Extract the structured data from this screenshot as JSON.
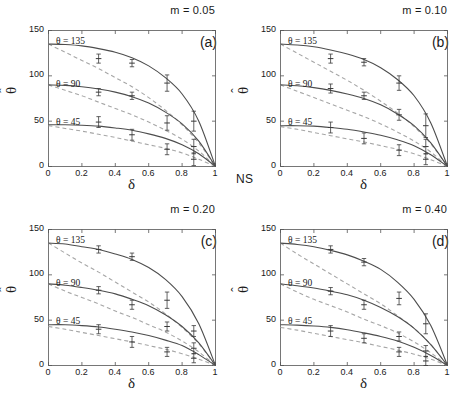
{
  "figure": {
    "ns_label": "NS",
    "xlabel": "δ",
    "ylabel_base": "θ",
    "ylabel_hat": "ˆ",
    "xticks": [
      "0",
      "0.2",
      "0.4",
      "0.6",
      "0.8",
      "1"
    ],
    "yticks": [
      "0",
      "50",
      "100",
      "150"
    ],
    "curve_labels": {
      "t135": "θ = 135",
      "t90": "θ = 90",
      "t45": "θ = 45"
    },
    "colors": {
      "solid_curve": "#4d4d4d",
      "dashed_curve": "#a6a6a6",
      "axis": "#555555",
      "marker": "#3a3a3a",
      "text": "#1a1a1a"
    }
  },
  "chart_data": [
    {
      "type": "line",
      "panel": "a",
      "tag": "(a)",
      "title": "m = 0.05",
      "xlabel": "δ",
      "ylabel": "θ̂",
      "xlim": [
        0,
        1
      ],
      "ylim": [
        0,
        150
      ],
      "grid": false,
      "legend": "inline-labels",
      "series": [
        {
          "name": "θ = 135 solid",
          "style": "solid",
          "x": [
            0,
            0.1,
            0.2,
            0.3,
            0.4,
            0.5,
            0.6,
            0.7,
            0.8,
            0.9,
            1.0
          ],
          "y": [
            135,
            134.5,
            133,
            130,
            126,
            120,
            111,
            98,
            80,
            50,
            0
          ]
        },
        {
          "name": "θ = 90 solid",
          "style": "solid",
          "x": [
            0,
            0.1,
            0.2,
            0.3,
            0.4,
            0.5,
            0.6,
            0.7,
            0.8,
            0.9,
            1.0
          ],
          "y": [
            90,
            89.5,
            88,
            85.5,
            82,
            77,
            70,
            60,
            47,
            28,
            0
          ]
        },
        {
          "name": "θ = 45 solid",
          "style": "solid",
          "x": [
            0,
            0.1,
            0.2,
            0.3,
            0.4,
            0.5,
            0.6,
            0.7,
            0.8,
            0.9,
            1.0
          ],
          "y": [
            46,
            46,
            45.5,
            44.5,
            42.5,
            40,
            36,
            31,
            24,
            14,
            0
          ]
        },
        {
          "name": "θ = 135 dashed",
          "style": "dashed",
          "x": [
            0,
            0.1,
            0.2,
            0.3,
            0.4,
            0.5,
            0.6,
            0.7,
            0.8,
            0.9,
            1.0
          ],
          "y": [
            135,
            126,
            117,
            108,
            98,
            88,
            76,
            62,
            46,
            26,
            0
          ]
        },
        {
          "name": "θ = 90 dashed",
          "style": "dashed",
          "x": [
            0,
            0.1,
            0.2,
            0.3,
            0.4,
            0.5,
            0.6,
            0.7,
            0.8,
            0.9,
            1.0
          ],
          "y": [
            90,
            84,
            78,
            71,
            64,
            57,
            49,
            40,
            30,
            17,
            0
          ]
        },
        {
          "name": "θ = 45 dashed",
          "style": "dashed",
          "x": [
            0,
            0.1,
            0.2,
            0.3,
            0.4,
            0.5,
            0.6,
            0.7,
            0.8,
            0.9,
            1.0
          ],
          "y": [
            45,
            42,
            39,
            35.5,
            32,
            28,
            24,
            20,
            15,
            8,
            0
          ]
        }
      ],
      "points": [
        {
          "group": "135",
          "x": 0.3,
          "y": 119,
          "err": 5
        },
        {
          "group": "135",
          "x": 0.5,
          "y": 114,
          "err": 4
        },
        {
          "group": "135",
          "x": 0.71,
          "y": 92,
          "err": 9
        },
        {
          "group": "135",
          "x": 0.87,
          "y": 50,
          "err": 11
        },
        {
          "group": "90",
          "x": 0.3,
          "y": 82,
          "err": 4
        },
        {
          "group": "90",
          "x": 0.5,
          "y": 78,
          "err": 4
        },
        {
          "group": "90",
          "x": 0.71,
          "y": 48,
          "err": 8
        },
        {
          "group": "90",
          "x": 0.87,
          "y": 22,
          "err": 8
        },
        {
          "group": "45",
          "x": 0.3,
          "y": 49,
          "err": 6
        },
        {
          "group": "45",
          "x": 0.5,
          "y": 35,
          "err": 6
        },
        {
          "group": "45",
          "x": 0.71,
          "y": 19,
          "err": 6
        },
        {
          "group": "45",
          "x": 0.87,
          "y": 8,
          "err": 7
        }
      ]
    },
    {
      "type": "line",
      "panel": "b",
      "tag": "(b)",
      "title": "m = 0.10",
      "xlabel": "δ",
      "ylabel": "θ̂",
      "xlim": [
        0,
        1
      ],
      "ylim": [
        0,
        150
      ],
      "grid": false,
      "legend": "inline-labels",
      "series": [
        {
          "name": "θ = 135 solid",
          "style": "solid",
          "x": [
            0,
            0.1,
            0.2,
            0.3,
            0.4,
            0.5,
            0.6,
            0.7,
            0.8,
            0.9,
            1.0
          ],
          "y": [
            135,
            134,
            132,
            128.5,
            124,
            118,
            109,
            96,
            78,
            48,
            0
          ]
        },
        {
          "name": "θ = 90 solid",
          "style": "solid",
          "x": [
            0,
            0.1,
            0.2,
            0.3,
            0.4,
            0.5,
            0.6,
            0.7,
            0.8,
            0.9,
            1.0
          ],
          "y": [
            90,
            89,
            87,
            84,
            80,
            75,
            68,
            58,
            45,
            26,
            0
          ]
        },
        {
          "name": "θ = 45 solid",
          "style": "solid",
          "x": [
            0,
            0.1,
            0.2,
            0.3,
            0.4,
            0.5,
            0.6,
            0.7,
            0.8,
            0.9,
            1.0
          ],
          "y": [
            45,
            45,
            44.5,
            43,
            41,
            38,
            34.5,
            29.5,
            23,
            13,
            0
          ]
        },
        {
          "name": "θ = 135 dashed",
          "style": "dashed",
          "x": [
            0,
            0.1,
            0.2,
            0.3,
            0.4,
            0.5,
            0.6,
            0.7,
            0.8,
            0.9,
            1.0
          ],
          "y": [
            135,
            125,
            115,
            105,
            95,
            84,
            72,
            59,
            44,
            25,
            0
          ]
        },
        {
          "name": "θ = 90 dashed",
          "style": "dashed",
          "x": [
            0,
            0.1,
            0.2,
            0.3,
            0.4,
            0.5,
            0.6,
            0.7,
            0.8,
            0.9,
            1.0
          ],
          "y": [
            90,
            83,
            76,
            69,
            62,
            55,
            47,
            38,
            28,
            16,
            0
          ]
        },
        {
          "name": "θ = 45 dashed",
          "style": "dashed",
          "x": [
            0,
            0.1,
            0.2,
            0.3,
            0.4,
            0.5,
            0.6,
            0.7,
            0.8,
            0.9,
            1.0
          ],
          "y": [
            44,
            41,
            37.5,
            34,
            30.5,
            27,
            23,
            19,
            14,
            7.5,
            0
          ]
        }
      ],
      "points": [
        {
          "group": "135",
          "x": 0.3,
          "y": 119,
          "err": 5
        },
        {
          "group": "135",
          "x": 0.5,
          "y": 115,
          "err": 4
        },
        {
          "group": "135",
          "x": 0.71,
          "y": 92,
          "err": 8
        },
        {
          "group": "135",
          "x": 0.87,
          "y": 45,
          "err": 13
        },
        {
          "group": "90",
          "x": 0.3,
          "y": 86,
          "err": 5
        },
        {
          "group": "90",
          "x": 0.5,
          "y": 78,
          "err": 4
        },
        {
          "group": "90",
          "x": 0.71,
          "y": 57,
          "err": 6
        },
        {
          "group": "90",
          "x": 0.87,
          "y": 22,
          "err": 8
        },
        {
          "group": "45",
          "x": 0.3,
          "y": 43,
          "err": 6
        },
        {
          "group": "45",
          "x": 0.5,
          "y": 31,
          "err": 6
        },
        {
          "group": "45",
          "x": 0.71,
          "y": 18,
          "err": 6
        },
        {
          "group": "45",
          "x": 0.87,
          "y": 8,
          "err": 6
        }
      ]
    },
    {
      "type": "line",
      "panel": "c",
      "tag": "(c)",
      "title": "m = 0.20",
      "xlabel": "δ",
      "ylabel": "θ̂",
      "xlim": [
        0,
        1
      ],
      "ylim": [
        0,
        150
      ],
      "grid": false,
      "legend": "inline-labels",
      "series": [
        {
          "name": "θ = 135 solid",
          "style": "solid",
          "x": [
            0,
            0.1,
            0.2,
            0.3,
            0.4,
            0.5,
            0.6,
            0.7,
            0.8,
            0.9,
            1.0
          ],
          "y": [
            135,
            134,
            131,
            128,
            123,
            117,
            108,
            95,
            76,
            46,
            0
          ]
        },
        {
          "name": "θ = 90 solid",
          "style": "solid",
          "x": [
            0,
            0.1,
            0.2,
            0.3,
            0.4,
            0.5,
            0.6,
            0.7,
            0.8,
            0.9,
            1.0
          ],
          "y": [
            90,
            88.5,
            86,
            83,
            79,
            73,
            66,
            56,
            43,
            25,
            0
          ]
        },
        {
          "name": "θ = 45 solid",
          "style": "solid",
          "x": [
            0,
            0.1,
            0.2,
            0.3,
            0.4,
            0.5,
            0.6,
            0.7,
            0.8,
            0.9,
            1.0
          ],
          "y": [
            45,
            45,
            44,
            42.5,
            40,
            37,
            33,
            28,
            22,
            12,
            0
          ]
        },
        {
          "name": "θ = 135 dashed",
          "style": "dashed",
          "x": [
            0,
            0.1,
            0.2,
            0.3,
            0.4,
            0.5,
            0.6,
            0.7,
            0.8,
            0.9,
            1.0
          ],
          "y": [
            135,
            124,
            113,
            103,
            92,
            81,
            70,
            57,
            42,
            24,
            0
          ]
        },
        {
          "name": "θ = 90 dashed",
          "style": "dashed",
          "x": [
            0,
            0.1,
            0.2,
            0.3,
            0.4,
            0.5,
            0.6,
            0.7,
            0.8,
            0.9,
            1.0
          ],
          "y": [
            90,
            82,
            75,
            68,
            60,
            53,
            45,
            37,
            27,
            15,
            0
          ]
        },
        {
          "name": "θ = 45 dashed",
          "style": "dashed",
          "x": [
            0,
            0.1,
            0.2,
            0.3,
            0.4,
            0.5,
            0.6,
            0.7,
            0.8,
            0.9,
            1.0
          ],
          "y": [
            43,
            40,
            36.5,
            33,
            29.5,
            26,
            22,
            18,
            13,
            7,
            0
          ]
        }
      ],
      "points": [
        {
          "group": "135",
          "x": 0.3,
          "y": 128,
          "err": 4
        },
        {
          "group": "135",
          "x": 0.5,
          "y": 120,
          "err": 4
        },
        {
          "group": "135",
          "x": 0.71,
          "y": 72,
          "err": 9
        },
        {
          "group": "135",
          "x": 0.87,
          "y": 38,
          "err": 6
        },
        {
          "group": "90",
          "x": 0.3,
          "y": 83,
          "err": 4
        },
        {
          "group": "90",
          "x": 0.5,
          "y": 67,
          "err": 5
        },
        {
          "group": "90",
          "x": 0.71,
          "y": 43,
          "err": 5
        },
        {
          "group": "90",
          "x": 0.87,
          "y": 19,
          "err": 6
        },
        {
          "group": "45",
          "x": 0.3,
          "y": 40,
          "err": 5
        },
        {
          "group": "45",
          "x": 0.5,
          "y": 26,
          "err": 6
        },
        {
          "group": "45",
          "x": 0.71,
          "y": 15,
          "err": 5
        },
        {
          "group": "45",
          "x": 0.87,
          "y": 8,
          "err": 5
        }
      ]
    },
    {
      "type": "line",
      "panel": "d",
      "tag": "(d)",
      "title": "m = 0.40",
      "xlabel": "δ",
      "ylabel": "θ̂",
      "xlim": [
        0,
        1
      ],
      "ylim": [
        0,
        150
      ],
      "grid": false,
      "legend": "inline-labels",
      "series": [
        {
          "name": "θ = 135 solid",
          "style": "solid",
          "x": [
            0,
            0.1,
            0.2,
            0.3,
            0.4,
            0.5,
            0.6,
            0.7,
            0.8,
            0.9,
            1.0
          ],
          "y": [
            135,
            133.5,
            131,
            127,
            122,
            115,
            106,
            92,
            73,
            44,
            0
          ]
        },
        {
          "name": "θ = 90 solid",
          "style": "solid",
          "x": [
            0,
            0.1,
            0.2,
            0.3,
            0.4,
            0.5,
            0.6,
            0.7,
            0.8,
            0.9,
            1.0
          ],
          "y": [
            90,
            88,
            85.5,
            82,
            78,
            72,
            64,
            54,
            41,
            23,
            0
          ]
        },
        {
          "name": "θ = 45 solid",
          "style": "solid",
          "x": [
            0,
            0.1,
            0.2,
            0.3,
            0.4,
            0.5,
            0.6,
            0.7,
            0.8,
            0.9,
            1.0
          ],
          "y": [
            45,
            44.5,
            43.5,
            42,
            39.5,
            36,
            32,
            27,
            20,
            11,
            0
          ]
        },
        {
          "name": "θ = 135 dashed",
          "style": "dashed",
          "x": [
            0,
            0.1,
            0.2,
            0.3,
            0.4,
            0.5,
            0.6,
            0.7,
            0.8,
            0.9,
            1.0
          ],
          "y": [
            135,
            123,
            112,
            101,
            90,
            79,
            68,
            55,
            41,
            23,
            0
          ]
        },
        {
          "name": "θ = 90 dashed",
          "style": "dashed",
          "x": [
            0,
            0.1,
            0.2,
            0.3,
            0.4,
            0.5,
            0.6,
            0.7,
            0.8,
            0.9,
            1.0
          ],
          "y": [
            90,
            81,
            73,
            66,
            59,
            51,
            44,
            36,
            26,
            14,
            0
          ]
        },
        {
          "name": "θ = 45 dashed",
          "style": "dashed",
          "x": [
            0,
            0.1,
            0.2,
            0.3,
            0.4,
            0.5,
            0.6,
            0.7,
            0.8,
            0.9,
            1.0
          ],
          "y": [
            42,
            39,
            35.5,
            32,
            28.5,
            25,
            21,
            17,
            12.5,
            7,
            0
          ]
        }
      ],
      "points": [
        {
          "group": "135",
          "x": 0.3,
          "y": 128,
          "err": 4
        },
        {
          "group": "135",
          "x": 0.5,
          "y": 114,
          "err": 4
        },
        {
          "group": "135",
          "x": 0.71,
          "y": 74,
          "err": 7
        },
        {
          "group": "135",
          "x": 0.87,
          "y": 46,
          "err": 11
        },
        {
          "group": "90",
          "x": 0.3,
          "y": 82,
          "err": 4
        },
        {
          "group": "90",
          "x": 0.5,
          "y": 67,
          "err": 5
        },
        {
          "group": "90",
          "x": 0.71,
          "y": 32,
          "err": 5
        },
        {
          "group": "90",
          "x": 0.87,
          "y": 16,
          "err": 6
        },
        {
          "group": "45",
          "x": 0.3,
          "y": 38,
          "err": 6
        },
        {
          "group": "45",
          "x": 0.5,
          "y": 30,
          "err": 5
        },
        {
          "group": "45",
          "x": 0.71,
          "y": 15,
          "err": 5
        },
        {
          "group": "45",
          "x": 0.87,
          "y": 5,
          "err": 5
        }
      ]
    }
  ]
}
